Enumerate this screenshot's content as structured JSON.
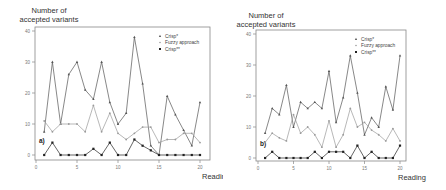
{
  "chart_data": [
    {
      "type": "line",
      "panel_label": "a)",
      "title": "",
      "ylabel": "Number of accepted variants",
      "xlabel": "Reading",
      "xlim": [
        0,
        20
      ],
      "ylim": [
        0,
        40
      ],
      "xticks": [
        0,
        5,
        10,
        15,
        20
      ],
      "yticks": [
        0,
        10,
        20,
        30,
        40
      ],
      "grid": false,
      "legend_position": "upper right",
      "x": [
        1,
        2,
        3,
        4,
        5,
        6,
        7,
        8,
        9,
        10,
        11,
        12,
        13,
        14,
        15,
        16,
        17,
        18,
        19,
        20
      ],
      "series": [
        {
          "name": "Crisp*",
          "color": "#555555",
          "marker": "triangle",
          "values": [
            7.5,
            30,
            10,
            26,
            30,
            21,
            18,
            30,
            17,
            10,
            13.5,
            38,
            23,
            3,
            0,
            19,
            13,
            8,
            3,
            17
          ]
        },
        {
          "name": "Fuzzy approach",
          "color": "#9a9a9a",
          "marker": "dot",
          "values": [
            11,
            7.5,
            10,
            10,
            10,
            7.5,
            16,
            7.5,
            13.5,
            7,
            5,
            7,
            9,
            9,
            4,
            5,
            5,
            7,
            7,
            4
          ]
        },
        {
          "name": "Crisp**",
          "color": "#222222",
          "marker": "square",
          "values": [
            0,
            4,
            0,
            0,
            0,
            0,
            2,
            0,
            4,
            0,
            0,
            5,
            3,
            1.5,
            0,
            0,
            0,
            0,
            0,
            0
          ]
        }
      ]
    },
    {
      "type": "line",
      "panel_label": "b)",
      "title": "",
      "ylabel": "Number of accepted variants",
      "xlabel": "Reading",
      "xlim": [
        0,
        20
      ],
      "ylim": [
        0,
        40
      ],
      "xticks": [
        0,
        5,
        10,
        15,
        20
      ],
      "yticks": [
        0,
        10,
        20,
        30,
        40
      ],
      "grid": false,
      "legend_position": "upper right",
      "x": [
        1,
        2,
        3,
        4,
        5,
        6,
        7,
        8,
        9,
        10,
        11,
        12,
        13,
        14,
        15,
        16,
        17,
        18,
        19,
        20
      ],
      "series": [
        {
          "name": "Crisp*",
          "color": "#555555",
          "marker": "triangle",
          "values": [
            8,
            16,
            14,
            23.5,
            10,
            18,
            16,
            18,
            16,
            28,
            11.5,
            19.5,
            33,
            21,
            7.5,
            13,
            10,
            23,
            15.5,
            33
          ]
        },
        {
          "name": "Fuzzy approach",
          "color": "#9a9a9a",
          "marker": "dot",
          "values": [
            5,
            8,
            6.5,
            5.5,
            14,
            8,
            10,
            7.5,
            3.5,
            12,
            3.5,
            7.5,
            16,
            10,
            11.5,
            9,
            7.5,
            5.5,
            9.5,
            5.5
          ]
        },
        {
          "name": "Crisp**",
          "color": "#222222",
          "marker": "square",
          "values": [
            0,
            2,
            0,
            0,
            0,
            0,
            0,
            2,
            0,
            2,
            2,
            2,
            0,
            4,
            0,
            2,
            0,
            0,
            0,
            4
          ]
        }
      ]
    }
  ],
  "panels": [
    {
      "ylabel_line1": "Number of",
      "ylabel_line2": "accepted variants",
      "xlabel": "Reading",
      "panel_label": "a)"
    },
    {
      "ylabel_line1": "Number of",
      "ylabel_line2": "accepted variants",
      "xlabel": "Reading",
      "panel_label": "b)"
    }
  ]
}
